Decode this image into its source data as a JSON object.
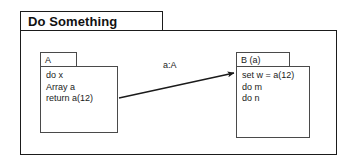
{
  "diagram": {
    "type": "uml-interaction-frame",
    "frame": {
      "title": "Do Something"
    },
    "objects": [
      {
        "id": "a",
        "header": "A",
        "lines": [
          "do x",
          "Array a",
          "return a(12)"
        ]
      },
      {
        "id": "b",
        "header": "B (a)",
        "lines": [
          "set w = a(12)",
          "do m",
          "do n"
        ]
      }
    ],
    "messages": [
      {
        "label": "a:A",
        "from": "a",
        "to": "b"
      }
    ],
    "colors": {
      "frame_stroke": "#1b1b1b",
      "box_stroke": "#4a4a4a",
      "arrow_stroke": "#1a1a1a",
      "text": "#1a1a1a",
      "background": "#ffffff"
    }
  }
}
